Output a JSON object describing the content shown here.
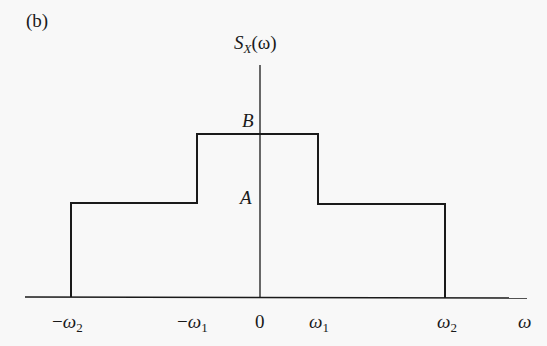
{
  "panel_label": "(b)",
  "y_axis_label": {
    "base": "S",
    "sub": "X",
    "arg": "(ω)"
  },
  "level_labels": {
    "high": "B",
    "low": "A"
  },
  "x_ticks": [
    {
      "sign": "−",
      "sym": "ω",
      "sub": "2"
    },
    {
      "sign": "−",
      "sym": "ω",
      "sub": "1"
    },
    {
      "sign": "",
      "sym": "0",
      "sub": ""
    },
    {
      "sign": "",
      "sym": "ω",
      "sub": "1"
    },
    {
      "sign": "",
      "sym": "ω",
      "sub": "2"
    }
  ],
  "x_axis_label": "ω",
  "colors": {
    "line": "#1a1a1a",
    "background": "#f8f8f8"
  }
}
